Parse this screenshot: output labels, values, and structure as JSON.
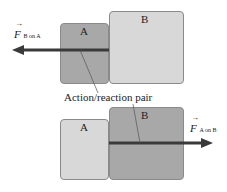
{
  "colors": {
    "dark_box": "#a8a8a8",
    "light_box": "#d8d8d8",
    "arrow": "#3a3a3a",
    "leader": "#555555"
  },
  "top_scene": {
    "box_a": {
      "label": "A",
      "shade": "dark"
    },
    "box_b": {
      "label": "B",
      "shade": "light"
    },
    "force": {
      "symbol": "F",
      "subscript": "B on A",
      "direction": "left"
    }
  },
  "bottom_scene": {
    "box_a": {
      "label": "A",
      "shade": "light"
    },
    "box_b": {
      "label": "B",
      "shade": "dark"
    },
    "force": {
      "symbol": "F",
      "subscript": "A on B",
      "direction": "right"
    }
  },
  "caption": "Action/reaction pair"
}
